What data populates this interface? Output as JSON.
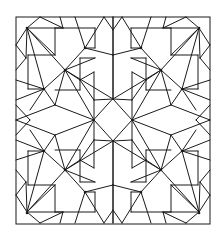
{
  "drawing": {
    "description": "Symmetric geometric star-and-polygon line pattern inside a square frame",
    "stroke_color": "#1a1a1a",
    "background_color": "#ffffff",
    "frame": {
      "x": 16,
      "y": 17,
      "w": 194,
      "h": 207
    },
    "center": {
      "x": 113,
      "y": 120
    },
    "central_diamond": [
      [
        113,
        99
      ],
      [
        132,
        120
      ],
      [
        113,
        141
      ],
      [
        94,
        120
      ]
    ],
    "quadrant_hubs": [
      [
        65,
        70
      ],
      [
        161,
        70
      ],
      [
        65,
        170
      ],
      [
        161,
        170
      ]
    ],
    "corner_hubs": [
      [
        27,
        28
      ],
      [
        199,
        28
      ],
      [
        27,
        213
      ],
      [
        199,
        213
      ]
    ],
    "edge_hubs": [
      [
        44,
        89
      ],
      [
        182,
        89
      ],
      [
        44,
        151
      ],
      [
        182,
        151
      ],
      [
        85,
        48
      ],
      [
        141,
        48
      ],
      [
        85,
        192
      ],
      [
        141,
        192
      ]
    ]
  }
}
